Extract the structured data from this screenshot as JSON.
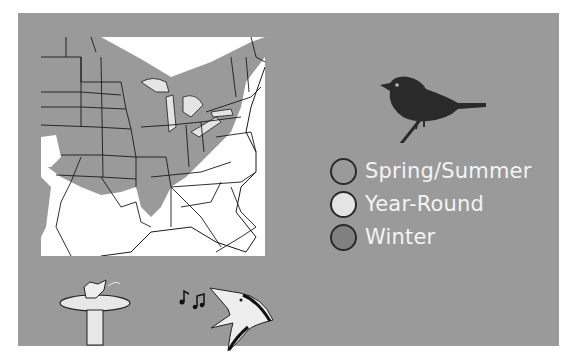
{
  "map": {
    "title": "Range map of eastern United States",
    "land_color": "#ffffff",
    "range_color": "#9a9a9a",
    "border_color": "#1a1a1a"
  },
  "panel": {
    "background": "#9a9a9a"
  },
  "legend": {
    "items": [
      {
        "label": "Spring/Summer",
        "color": "#9a9a9a"
      },
      {
        "label": "Year-Round",
        "color": "#e4e4e4"
      },
      {
        "label": "Winter",
        "color": "#808080"
      }
    ]
  },
  "icons": {
    "bird": "perched-bird-silhouette",
    "birdbath": "bird-in-birdbath",
    "notes": "music-notes",
    "singer": "singing-bird-head"
  }
}
